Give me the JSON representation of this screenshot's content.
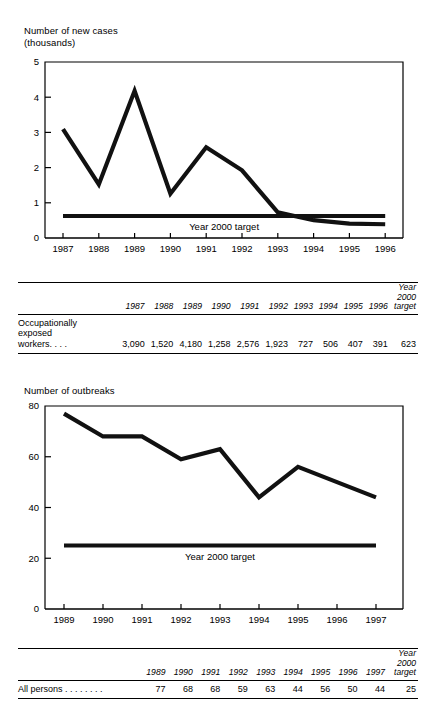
{
  "chart_data": [
    {
      "type": "line",
      "id": "new-cases",
      "title": "Number of new cases\n(thousands)",
      "ylabel": "Number of new cases (thousands)",
      "xlabel": "",
      "categories": [
        "1987",
        "1988",
        "1989",
        "1990",
        "1991",
        "1992",
        "1993",
        "1994",
        "1995",
        "1996"
      ],
      "ylim": [
        0,
        5
      ],
      "yticks": [
        0,
        1,
        2,
        3,
        4,
        5
      ],
      "grid": false,
      "legend": "none",
      "series": [
        {
          "name": "Occupationally exposed workers",
          "values": [
            3.09,
            1.52,
            4.18,
            1.258,
            2.576,
            1.923,
            0.727,
            0.506,
            0.407,
            0.391
          ]
        },
        {
          "name": "Year 2000 target",
          "annotation": "Year 2000 target",
          "constant": 0.623
        }
      ]
    },
    {
      "type": "line",
      "id": "outbreaks",
      "title": "Number of outbreaks",
      "ylabel": "Number of outbreaks",
      "xlabel": "",
      "categories": [
        "1989",
        "1990",
        "1991",
        "1992",
        "1993",
        "1994",
        "1995",
        "1996",
        "1997"
      ],
      "ylim": [
        0,
        80
      ],
      "yticks": [
        0,
        20,
        40,
        60,
        80
      ],
      "grid": false,
      "legend": "none",
      "series": [
        {
          "name": "All persons",
          "values": [
            77,
            68,
            68,
            59,
            63,
            44,
            56,
            50,
            44
          ]
        },
        {
          "name": "Year 2000 target",
          "annotation": "Year 2000 target",
          "constant": 25
        }
      ]
    }
  ],
  "figure1": {
    "axis_title": "Number of new cases\n(thousands)",
    "target_label": "Year 2000 target",
    "y_ticks": [
      "5",
      "4",
      "3",
      "2",
      "1",
      "0"
    ],
    "x_ticks": [
      "1987",
      "1988",
      "1989",
      "1990",
      "1991",
      "1992",
      "1993",
      "1994",
      "1995",
      "1996"
    ]
  },
  "figure2": {
    "axis_title": "Number of outbreaks",
    "target_label": "Year 2000 target",
    "y_ticks": [
      "80",
      "60",
      "40",
      "20",
      "0"
    ],
    "x_ticks": [
      "1989",
      "1990",
      "1991",
      "1992",
      "1993",
      "1994",
      "1995",
      "1996",
      "1997"
    ]
  },
  "table1": {
    "columns": [
      "1987",
      "1988",
      "1989",
      "1990",
      "1991",
      "1992",
      "1993",
      "1994",
      "1995",
      "1996"
    ],
    "target_column": "Year\n2000\ntarget",
    "rows": [
      {
        "label": "Occupationally\n  exposed\n  workers. . . .",
        "values": [
          "3,090",
          "1,520",
          "4,180",
          "1,258",
          "2,576",
          "1,923",
          "727",
          "506",
          "407",
          "391"
        ],
        "target": "623"
      }
    ]
  },
  "table2": {
    "columns": [
      "1989",
      "1990",
      "1991",
      "1992",
      "1993",
      "1994",
      "1995",
      "1996",
      "1997"
    ],
    "target_column": "Year\n2000\ntarget",
    "rows": [
      {
        "label": "All persons . . . . . . . .",
        "values": [
          "77",
          "68",
          "68",
          "59",
          "63",
          "44",
          "56",
          "50",
          "44"
        ],
        "target": "25"
      }
    ]
  }
}
